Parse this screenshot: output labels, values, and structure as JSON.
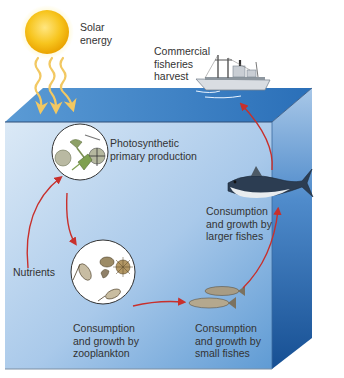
{
  "diagram": {
    "title_fragment": "of energy.",
    "labels": {
      "solar_energy": "Solar\nenergy",
      "commercial_harvest": "Commercial\nfisheries\nharvest",
      "photosynthetic": "Photosynthetic\nprimary production",
      "nutrients": "Nutrients",
      "zooplankton": "Consumption\nand growth by\nzooplankton",
      "small_fishes": "Consumption\nand growth by\nsmall fishes",
      "larger_fishes": "Consumption\nand growth by\nlarger fishes"
    },
    "nodes": [
      "Solar energy",
      "Photosynthetic primary production",
      "Nutrients",
      "Consumption and growth by zooplankton",
      "Consumption and growth by small fishes",
      "Consumption and growth by larger fishes",
      "Commercial fisheries harvest"
    ],
    "edges": [
      {
        "from": "Solar energy",
        "to": "Photosynthetic primary production"
      },
      {
        "from": "Nutrients",
        "to": "Photosynthetic primary production"
      },
      {
        "from": "Photosynthetic primary production",
        "to": "Consumption and growth by zooplankton"
      },
      {
        "from": "Consumption and growth by zooplankton",
        "to": "Consumption and growth by small fishes"
      },
      {
        "from": "Consumption and growth by small fishes",
        "to": "Consumption and growth by larger fishes"
      },
      {
        "from": "Consumption and growth by larger fishes",
        "to": "Commercial fisheries harvest"
      }
    ],
    "colors": {
      "arrow": "#c8302c",
      "sun": "#f5b800",
      "ray": "#f2c862",
      "water_top": "#3d86c6",
      "water_front_top": "#cfe2f3",
      "water_front_bottom": "#6fa7d9",
      "water_side": "#1d5fa8"
    }
  }
}
